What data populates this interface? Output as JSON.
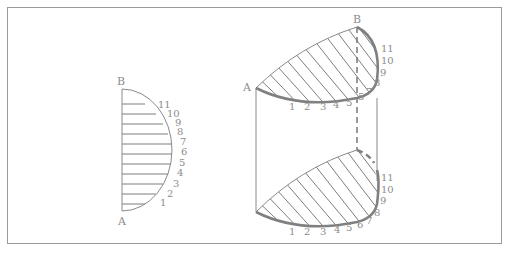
{
  "diagram": {
    "type": "technical-drawing",
    "colors": {
      "line": "#808080",
      "label": "#8c8c8c",
      "frame": "#9a9a9a",
      "background": "#ffffff"
    },
    "left_figure": {
      "endpoints": {
        "top": "B",
        "bottom": "A"
      },
      "point_labels": [
        "1",
        "2",
        "3",
        "4",
        "5",
        "6",
        "7",
        "8",
        "9",
        "10",
        "11"
      ]
    },
    "right_figure": {
      "top_face": {
        "endpoints": {
          "left": "A",
          "right": "B"
        },
        "bottom_labels": [
          "1",
          "2",
          "3",
          "4",
          "5"
        ],
        "side_labels": [
          "7",
          "8",
          "9",
          "10",
          "11"
        ],
        "dashed_crossing_label": "5"
      },
      "bottom_face": {
        "bottom_labels": [
          "1",
          "2",
          "3",
          "4",
          "5",
          "6",
          "7"
        ],
        "side_labels": [
          "8",
          "9",
          "10",
          "11"
        ]
      }
    }
  }
}
